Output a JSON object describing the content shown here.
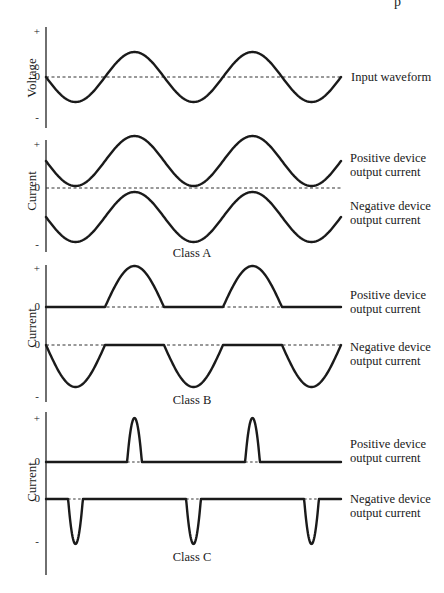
{
  "corner_text": "p",
  "panels": [
    {
      "id": "input",
      "ylabel": "Voltage",
      "ticks": {
        "plus": "+",
        "zero": "0",
        "minus": "-"
      },
      "labels": [
        "Input waveform"
      ],
      "class_label": ""
    },
    {
      "id": "class-a",
      "ylabel": "Current",
      "ticks": {
        "plus": "+",
        "zero": "0",
        "minus": "-"
      },
      "labels": [
        "Positive device output current",
        "Negative device output current"
      ],
      "label_lines": {
        "pos1": "Positive device",
        "pos2": "output current",
        "neg1": "Negative device",
        "neg2": "output current"
      },
      "class_label": "Class A"
    },
    {
      "id": "class-b",
      "ylabel": "Current",
      "ticks": {
        "plus": "+",
        "zero_pos": "0",
        "zero_neg": "0",
        "minus": "-"
      },
      "label_lines": {
        "pos1": "Positive device",
        "pos2": "output current",
        "neg1": "Negative device",
        "neg2": "output current"
      },
      "class_label": "Class B"
    },
    {
      "id": "class-c",
      "ylabel": "Current",
      "ticks": {
        "plus": "+",
        "zero_pos": "0",
        "zero_neg": "0",
        "minus": "-"
      },
      "label_lines": {
        "pos1": "Positive device",
        "pos2": "output current",
        "neg1": "Negative device",
        "neg2": "output current"
      },
      "class_label": "Class C"
    }
  ],
  "waveform": {
    "cycles": 2.5,
    "conduction_angle_deg": {
      "class_a": 360,
      "class_b": 180,
      "class_c": 45
    }
  }
}
